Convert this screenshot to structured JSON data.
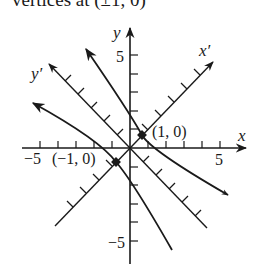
{
  "header_text": "vertices at (±1, 0)",
  "diagram": {
    "axes": {
      "x_label": "x",
      "y_label": "y",
      "x_prime_label": "x′",
      "y_prime_label": "y′"
    },
    "tick_labels": {
      "x_neg5": "−5",
      "x_pos5": "5",
      "y_pos5": "5",
      "y_neg5": "−5"
    },
    "points": {
      "vertex_pos_label": "(1, 0)",
      "vertex_neg_label": "(−1, 0)"
    },
    "colors": {
      "stroke": "#1a1a1a",
      "background": "#ffffff"
    }
  }
}
